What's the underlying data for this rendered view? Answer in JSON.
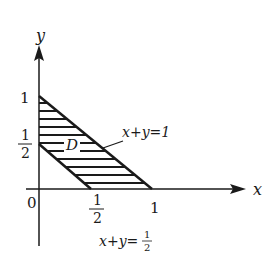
{
  "diagram": {
    "axes": {
      "x_label": "x",
      "y_label": "y",
      "origin_label": "0"
    },
    "ticks": {
      "x": [
        {
          "num": "1",
          "den": "2"
        },
        {
          "value": "1"
        }
      ],
      "y": [
        {
          "value": "1"
        },
        {
          "num": "1",
          "den": "2"
        }
      ]
    },
    "region_label": "D",
    "lines": [
      {
        "label": "x+y=1"
      },
      {
        "label_prefix": "x+y=",
        "num": "1",
        "den": "2"
      }
    ],
    "colors": {
      "ink": "#1a1a1a",
      "background": "#ffffff"
    }
  }
}
